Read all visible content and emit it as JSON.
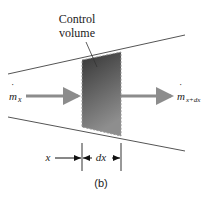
{
  "figure": {
    "caption": "(b)",
    "control_volume_label_line1": "Control",
    "control_volume_label_line2": "volume",
    "inflow": {
      "symbol": "m",
      "dot": "˙",
      "subscript": "x"
    },
    "outflow": {
      "symbol": "m",
      "dot": "˙",
      "subscript": "x+dx"
    },
    "position_label": "x",
    "width_label": "dx"
  },
  "colors": {
    "duct_lines": "#555555",
    "arrow": "#8c8c8c",
    "volume_dark": "#3a3a3a",
    "volume_light": "#8a8a8a",
    "text": "#222222"
  }
}
